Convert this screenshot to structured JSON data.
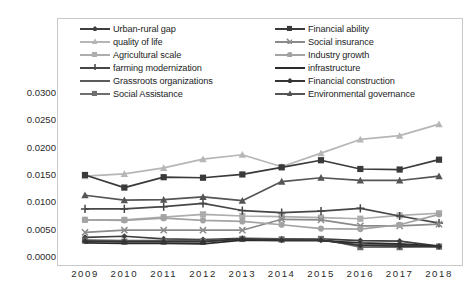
{
  "chart_data": {
    "type": "line",
    "title": "",
    "xlabel": "",
    "ylabel": "",
    "categories": [
      "2009",
      "2010",
      "2011",
      "2012",
      "2013",
      "2014",
      "2015",
      "2016",
      "2017",
      "2018"
    ],
    "ylim": [
      0.0,
      0.03
    ],
    "ytick_labels": [
      "0.0300",
      "0.0250",
      "0.0200",
      "0.0150",
      "0.0100",
      "0.0050",
      "0.0000"
    ],
    "ytick_values": [
      0.03,
      0.025,
      0.02,
      0.015,
      0.01,
      0.005,
      0.0
    ],
    "grid": false,
    "legend_position": "top",
    "series": [
      {
        "name": "Urban-rural gap",
        "color": "#3f3f3f",
        "marker": "diamond",
        "values": [
          0.0036,
          0.0038,
          0.0033,
          0.0032,
          0.0034,
          0.0033,
          0.0033,
          0.003,
          0.0029,
          0.002
        ]
      },
      {
        "name": "quality of life",
        "color": "#b6b6b6",
        "marker": "triangle",
        "values": [
          0.0148,
          0.0152,
          0.0163,
          0.0179,
          0.0187,
          0.0165,
          0.019,
          0.0215,
          0.0222,
          0.0243
        ]
      },
      {
        "name": "Agricultural scale",
        "color": "#adadad",
        "marker": "square",
        "values": [
          0.0068,
          0.0068,
          0.0073,
          0.0078,
          0.0075,
          0.0074,
          0.0072,
          0.007,
          0.0076,
          0.008
        ]
      },
      {
        "name": "farming modernization",
        "color": "#474747",
        "marker": "plus",
        "values": [
          0.0088,
          0.0088,
          0.0092,
          0.0098,
          0.0085,
          0.0081,
          0.0084,
          0.0089,
          0.0075,
          0.0062
        ]
      },
      {
        "name": "Grassroots organizations",
        "color": "#5c5c5c",
        "marker": "none",
        "values": [
          0.0031,
          0.003,
          0.003,
          0.003,
          0.0032,
          0.0031,
          0.0031,
          0.0022,
          0.0022,
          0.0019
        ]
      },
      {
        "name": "Social Assistance",
        "color": "#6e6e6e",
        "marker": "square",
        "values": [
          0.003,
          0.0028,
          0.0028,
          0.0028,
          0.0033,
          0.0032,
          0.0033,
          0.0018,
          0.0018,
          0.0019
        ]
      },
      {
        "name": "Financial ability",
        "color": "#3a3a3a",
        "marker": "square",
        "values": [
          0.015,
          0.0127,
          0.0146,
          0.0145,
          0.0151,
          0.0164,
          0.0177,
          0.0161,
          0.016,
          0.0178
        ]
      },
      {
        "name": "Social insurance",
        "color": "#8a8a8a",
        "marker": "x",
        "values": [
          0.0045,
          0.0049,
          0.0049,
          0.0049,
          0.0049,
          0.0069,
          0.0068,
          0.0057,
          0.0057,
          0.006
        ]
      },
      {
        "name": "Industry growth",
        "color": "#a3a3a3",
        "marker": "circle",
        "values": [
          0.0068,
          0.0067,
          0.0071,
          0.0067,
          0.0065,
          0.0059,
          0.0052,
          0.0051,
          0.0059,
          0.0078
        ]
      },
      {
        "name": "infrastructure",
        "color": "#2b2b2b",
        "marker": "none",
        "values": [
          0.0026,
          0.0025,
          0.0025,
          0.0024,
          0.0031,
          0.003,
          0.003,
          0.0026,
          0.0024,
          0.002
        ]
      },
      {
        "name": "Financial construction",
        "color": "#353535",
        "marker": "diamond",
        "values": [
          0.0029,
          0.0028,
          0.0028,
          0.0028,
          0.0033,
          0.0031,
          0.0031,
          0.0021,
          0.002,
          0.0019
        ]
      },
      {
        "name": "Environmental governance",
        "color": "#555555",
        "marker": "triangle",
        "values": [
          0.0113,
          0.0104,
          0.0105,
          0.011,
          0.0103,
          0.0138,
          0.0145,
          0.014,
          0.014,
          0.0148
        ]
      }
    ],
    "legend_columns": [
      [
        "Urban-rural gap",
        "quality of life",
        "Agricultural scale",
        "farming modernization",
        "Grassroots organizations",
        "Social Assistance"
      ],
      [
        "Financial ability",
        "Social insurance",
        "Industry growth",
        "infrastructure",
        "Financial construction",
        "Environmental governance"
      ]
    ]
  }
}
